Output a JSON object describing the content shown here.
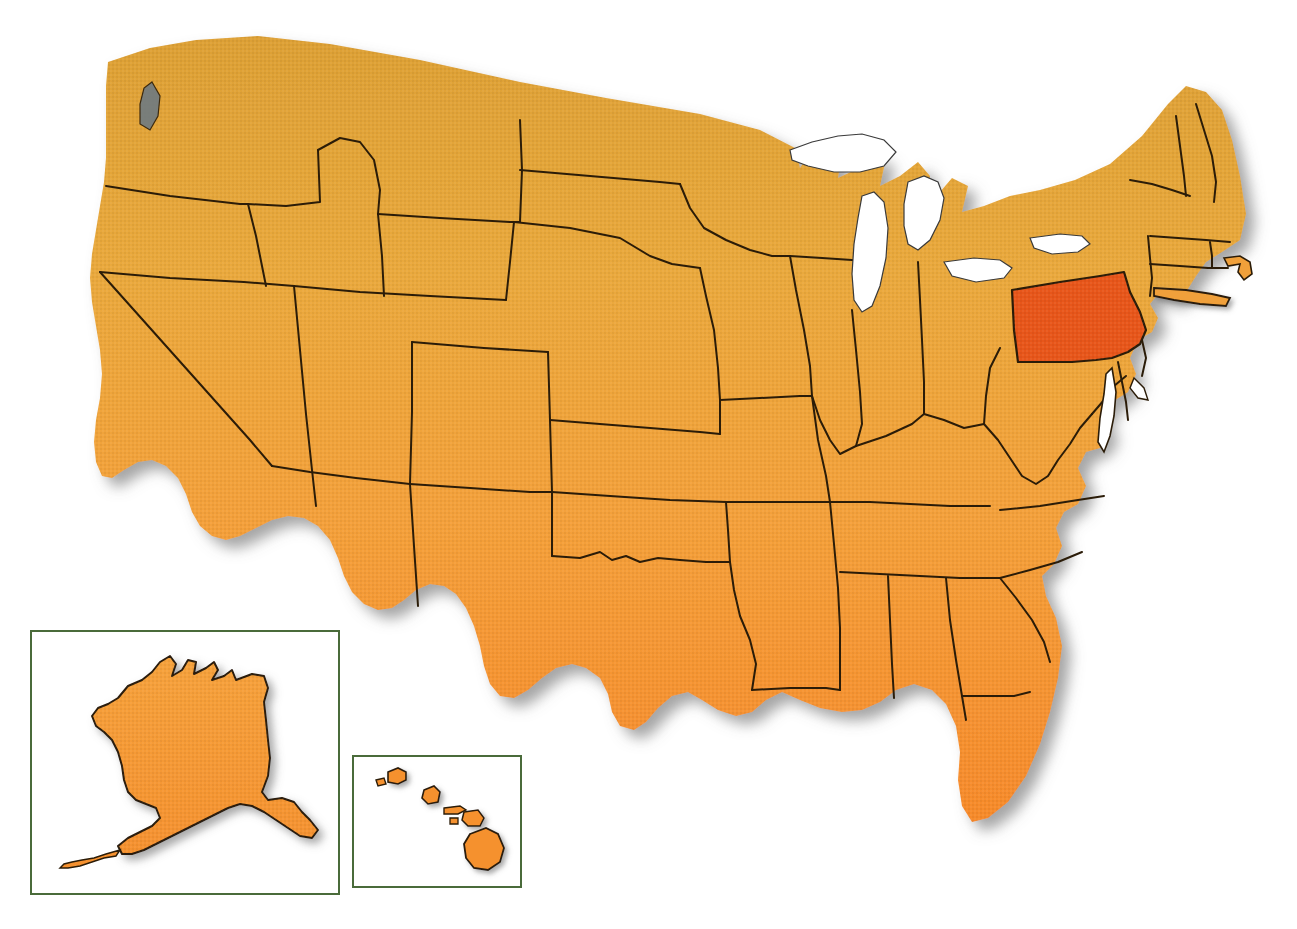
{
  "map": {
    "title": "United States of America",
    "type": "choropleth-locator-map",
    "projection": "albers-usa-style",
    "background_color": "#ffffff",
    "base_fill_north": "#dfa135",
    "base_fill_mid": "#f0a83c",
    "base_fill_south": "#f68b2c",
    "highlight_fill": "#e8561a",
    "border_color": "#2b1c08",
    "water_fill": "#ffffff",
    "shadow_color": "#8b8b8b",
    "inset_border_color": "#4a6b3a",
    "highlighted_state": "Pennsylvania",
    "highlighted_state_code": "PA",
    "insets": [
      {
        "id": "alaska",
        "label": "Alaska",
        "code": "AK",
        "border_color": "#4a6b3a"
      },
      {
        "id": "hawaii",
        "label": "Hawaii",
        "code": "HI",
        "border_color": "#4a6b3a"
      }
    ],
    "states": [
      {
        "code": "WA",
        "name": "Washington",
        "highlighted": false
      },
      {
        "code": "OR",
        "name": "Oregon",
        "highlighted": false
      },
      {
        "code": "CA",
        "name": "California",
        "highlighted": false
      },
      {
        "code": "NV",
        "name": "Nevada",
        "highlighted": false
      },
      {
        "code": "ID",
        "name": "Idaho",
        "highlighted": false
      },
      {
        "code": "MT",
        "name": "Montana",
        "highlighted": false
      },
      {
        "code": "WY",
        "name": "Wyoming",
        "highlighted": false
      },
      {
        "code": "UT",
        "name": "Utah",
        "highlighted": false
      },
      {
        "code": "AZ",
        "name": "Arizona",
        "highlighted": false
      },
      {
        "code": "NM",
        "name": "New Mexico",
        "highlighted": false
      },
      {
        "code": "CO",
        "name": "Colorado",
        "highlighted": false
      },
      {
        "code": "ND",
        "name": "North Dakota",
        "highlighted": false
      },
      {
        "code": "SD",
        "name": "South Dakota",
        "highlighted": false
      },
      {
        "code": "NE",
        "name": "Nebraska",
        "highlighted": false
      },
      {
        "code": "KS",
        "name": "Kansas",
        "highlighted": false
      },
      {
        "code": "OK",
        "name": "Oklahoma",
        "highlighted": false
      },
      {
        "code": "TX",
        "name": "Texas",
        "highlighted": false
      },
      {
        "code": "MN",
        "name": "Minnesota",
        "highlighted": false
      },
      {
        "code": "IA",
        "name": "Iowa",
        "highlighted": false
      },
      {
        "code": "MO",
        "name": "Missouri",
        "highlighted": false
      },
      {
        "code": "AR",
        "name": "Arkansas",
        "highlighted": false
      },
      {
        "code": "LA",
        "name": "Louisiana",
        "highlighted": false
      },
      {
        "code": "WI",
        "name": "Wisconsin",
        "highlighted": false
      },
      {
        "code": "IL",
        "name": "Illinois",
        "highlighted": false
      },
      {
        "code": "MI",
        "name": "Michigan",
        "highlighted": false
      },
      {
        "code": "IN",
        "name": "Indiana",
        "highlighted": false
      },
      {
        "code": "OH",
        "name": "Ohio",
        "highlighted": false
      },
      {
        "code": "KY",
        "name": "Kentucky",
        "highlighted": false
      },
      {
        "code": "TN",
        "name": "Tennessee",
        "highlighted": false
      },
      {
        "code": "MS",
        "name": "Mississippi",
        "highlighted": false
      },
      {
        "code": "AL",
        "name": "Alabama",
        "highlighted": false
      },
      {
        "code": "GA",
        "name": "Georgia",
        "highlighted": false
      },
      {
        "code": "FL",
        "name": "Florida",
        "highlighted": false
      },
      {
        "code": "SC",
        "name": "South Carolina",
        "highlighted": false
      },
      {
        "code": "NC",
        "name": "North Carolina",
        "highlighted": false
      },
      {
        "code": "VA",
        "name": "Virginia",
        "highlighted": false
      },
      {
        "code": "WV",
        "name": "West Virginia",
        "highlighted": false
      },
      {
        "code": "MD",
        "name": "Maryland",
        "highlighted": false
      },
      {
        "code": "DE",
        "name": "Delaware",
        "highlighted": false
      },
      {
        "code": "PA",
        "name": "Pennsylvania",
        "highlighted": true
      },
      {
        "code": "NJ",
        "name": "New Jersey",
        "highlighted": false
      },
      {
        "code": "NY",
        "name": "New York",
        "highlighted": false
      },
      {
        "code": "CT",
        "name": "Connecticut",
        "highlighted": false
      },
      {
        "code": "RI",
        "name": "Rhode Island",
        "highlighted": false
      },
      {
        "code": "MA",
        "name": "Massachusetts",
        "highlighted": false
      },
      {
        "code": "VT",
        "name": "Vermont",
        "highlighted": false
      },
      {
        "code": "NH",
        "name": "New Hampshire",
        "highlighted": false
      },
      {
        "code": "ME",
        "name": "Maine",
        "highlighted": false
      },
      {
        "code": "AK",
        "name": "Alaska",
        "highlighted": false
      },
      {
        "code": "HI",
        "name": "Hawaii",
        "highlighted": false
      }
    ]
  }
}
